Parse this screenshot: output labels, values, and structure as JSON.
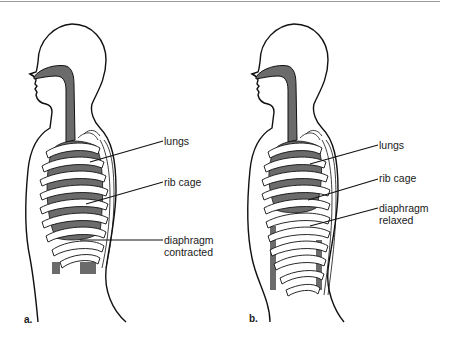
{
  "figure": {
    "panels": [
      {
        "letter": "a.",
        "labels": {
          "lungs": "lungs",
          "rib_cage": "rib cage",
          "diaphragm_line1": "diaphragm",
          "diaphragm_line2": "contracted"
        }
      },
      {
        "letter": "b.",
        "labels": {
          "lungs": "lungs",
          "rib_cage": "rib cage",
          "diaphragm_line1": "diaphragm",
          "diaphragm_line2": "relaxed"
        }
      }
    ],
    "colors": {
      "outline": "#111111",
      "lung_fill": "#6b6b6b",
      "rib_fill": "#ffffff",
      "background": "#ffffff"
    }
  }
}
